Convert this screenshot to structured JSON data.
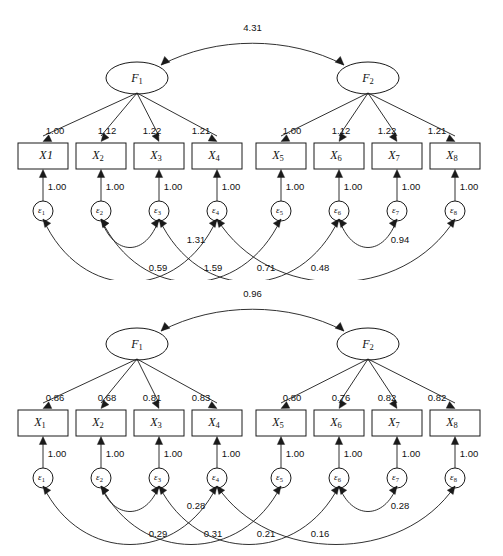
{
  "figure": {
    "type": "path-diagram",
    "panels": [
      {
        "id": "unstandardized",
        "factors": [
          {
            "name": "F",
            "subscript": "1"
          },
          {
            "name": "F",
            "subscript": "2"
          }
        ],
        "factor_covariance": "4.31",
        "indicators": [
          {
            "name": "X",
            "subscript": "1",
            "show_subscript": false,
            "label": "X1"
          },
          {
            "name": "X",
            "subscript": "2",
            "show_subscript": true,
            "label": "X2"
          },
          {
            "name": "X",
            "subscript": "3",
            "show_subscript": true,
            "label": "X3"
          },
          {
            "name": "X",
            "subscript": "4",
            "show_subscript": true,
            "label": "X4"
          },
          {
            "name": "X",
            "subscript": "5",
            "show_subscript": true,
            "label": "X5"
          },
          {
            "name": "X",
            "subscript": "6",
            "show_subscript": true,
            "label": "X6"
          },
          {
            "name": "X",
            "subscript": "7",
            "show_subscript": true,
            "label": "X7"
          },
          {
            "name": "X",
            "subscript": "8",
            "show_subscript": true,
            "label": "X8"
          }
        ],
        "errors": [
          {
            "name": "ε",
            "subscript": "1"
          },
          {
            "name": "ε",
            "subscript": "2"
          },
          {
            "name": "ε",
            "subscript": "3"
          },
          {
            "name": "ε",
            "subscript": "4"
          },
          {
            "name": "ε",
            "subscript": "5"
          },
          {
            "name": "ε",
            "subscript": "6"
          },
          {
            "name": "ε",
            "subscript": "7"
          },
          {
            "name": "ε",
            "subscript": "8"
          }
        ],
        "loadings": [
          "1.00",
          "1.12",
          "1.22",
          "1.21",
          "1.00",
          "1.12",
          "1.22",
          "1.21"
        ],
        "residual_paths": [
          "1.00",
          "1.00",
          "1.00",
          "1.00",
          "1.00",
          "1.00",
          "1.00",
          "1.00"
        ],
        "error_covariances": [
          {
            "label": "1.31",
            "from": 2,
            "to": 3
          },
          {
            "label": "0.94",
            "from": 6,
            "to": 7
          },
          {
            "label": "0.59",
            "from": 1,
            "to": 4
          },
          {
            "label": "1.59",
            "from": 2,
            "to": 5
          },
          {
            "label": "0.71",
            "from": 3,
            "to": 6
          },
          {
            "label": "0.48",
            "from": 4,
            "to": 8
          }
        ]
      },
      {
        "id": "standardized",
        "factors": [
          {
            "name": "F",
            "subscript": "1"
          },
          {
            "name": "F",
            "subscript": "2"
          }
        ],
        "factor_covariance": "0.96",
        "indicators": [
          {
            "name": "X",
            "subscript": "1",
            "show_subscript": true,
            "label": "X1"
          },
          {
            "name": "X",
            "subscript": "2",
            "show_subscript": true,
            "label": "X2"
          },
          {
            "name": "X",
            "subscript": "3",
            "show_subscript": true,
            "label": "X3"
          },
          {
            "name": "X",
            "subscript": "4",
            "show_subscript": true,
            "label": "X4"
          },
          {
            "name": "X",
            "subscript": "5",
            "show_subscript": true,
            "label": "X5"
          },
          {
            "name": "X",
            "subscript": "6",
            "show_subscript": true,
            "label": "X6"
          },
          {
            "name": "X",
            "subscript": "7",
            "show_subscript": true,
            "label": "X7"
          },
          {
            "name": "X",
            "subscript": "8",
            "show_subscript": true,
            "label": "X8"
          }
        ],
        "errors": [
          {
            "name": "ε",
            "subscript": "1"
          },
          {
            "name": "ε",
            "subscript": "2"
          },
          {
            "name": "ε",
            "subscript": "3"
          },
          {
            "name": "ε",
            "subscript": "4"
          },
          {
            "name": "ε",
            "subscript": "5"
          },
          {
            "name": "ε",
            "subscript": "6"
          },
          {
            "name": "ε",
            "subscript": "7"
          },
          {
            "name": "ε",
            "subscript": "8"
          }
        ],
        "loadings": [
          "0.86",
          "0.68",
          "0.81",
          "0.83",
          "0.80",
          "0.76",
          "0.82",
          "0.82"
        ],
        "residual_paths": [
          "1.00",
          "1.00",
          "1.00",
          "1.00",
          "1.00",
          "1.00",
          "1.00",
          "1.00"
        ],
        "error_covariances": [
          {
            "label": "0.28",
            "from": 2,
            "to": 3
          },
          {
            "label": "0.28",
            "from": 6,
            "to": 7
          },
          {
            "label": "0.29",
            "from": 1,
            "to": 4
          },
          {
            "label": "0.31",
            "from": 2,
            "to": 5
          },
          {
            "label": "0.21",
            "from": 3,
            "to": 6
          },
          {
            "label": "0.16",
            "from": 4,
            "to": 8
          }
        ]
      }
    ]
  },
  "colors": {
    "stroke": "#1a1a1a",
    "fill": "#ffffff",
    "background": "#ffffff"
  }
}
